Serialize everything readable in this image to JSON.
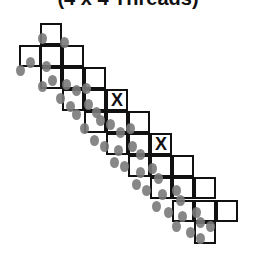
{
  "title": "(4 x 4 Threads)",
  "cell_size": 22,
  "colors": {
    "border": "#111111",
    "dot": "#7a7a7a"
  },
  "cells": [
    [
      40,
      23
    ],
    [
      19,
      45
    ],
    [
      40,
      45
    ],
    [
      62,
      45
    ],
    [
      40,
      67
    ],
    [
      62,
      67
    ],
    [
      84,
      67
    ],
    [
      62,
      89
    ],
    [
      84,
      89
    ],
    [
      106,
      89,
      "X"
    ],
    [
      84,
      111
    ],
    [
      106,
      111
    ],
    [
      128,
      111
    ],
    [
      106,
      133
    ],
    [
      128,
      133
    ],
    [
      150,
      133,
      "X"
    ],
    [
      128,
      155
    ],
    [
      150,
      155
    ],
    [
      172,
      155
    ],
    [
      150,
      177
    ],
    [
      172,
      177
    ],
    [
      194,
      177
    ],
    [
      172,
      200
    ],
    [
      194,
      200
    ],
    [
      216,
      200
    ],
    [
      194,
      222
    ]
  ],
  "dots": [
    [
      42,
      38
    ],
    [
      64,
      42
    ],
    [
      30,
      62
    ],
    [
      46,
      66
    ],
    [
      20,
      70
    ],
    [
      52,
      80
    ],
    [
      66,
      84
    ],
    [
      42,
      86
    ],
    [
      76,
      90
    ],
    [
      86,
      88
    ],
    [
      60,
      98
    ],
    [
      70,
      106
    ],
    [
      88,
      104
    ],
    [
      96,
      112
    ],
    [
      76,
      114
    ],
    [
      100,
      120
    ],
    [
      110,
      124
    ],
    [
      84,
      128
    ],
    [
      120,
      132
    ],
    [
      130,
      128
    ],
    [
      94,
      140
    ],
    [
      104,
      146
    ],
    [
      118,
      150
    ],
    [
      132,
      146
    ],
    [
      140,
      154
    ],
    [
      114,
      162
    ],
    [
      124,
      166
    ],
    [
      140,
      172
    ],
    [
      152,
      168
    ],
    [
      158,
      178
    ],
    [
      136,
      184
    ],
    [
      146,
      190
    ],
    [
      162,
      194
    ],
    [
      176,
      190
    ],
    [
      180,
      200
    ],
    [
      156,
      206
    ],
    [
      168,
      212
    ],
    [
      182,
      216
    ],
    [
      196,
      212
    ],
    [
      200,
      222
    ],
    [
      176,
      226
    ],
    [
      190,
      232
    ],
    [
      210,
      226
    ],
    [
      200,
      238
    ]
  ]
}
